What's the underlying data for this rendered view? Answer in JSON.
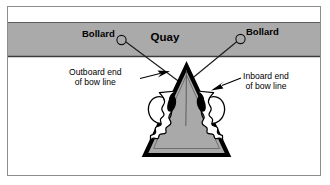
{
  "figure": {
    "title_text": "Mooring bow line diagram",
    "background_color": "#ffffff",
    "frame_color": "#8d8d8d"
  },
  "quay": {
    "label": "Quay",
    "fill_color": "#aaaaaa",
    "edge_color": "#4a4a4a",
    "bollards": [
      {
        "label": "Bollard",
        "side": "left"
      },
      {
        "label": "Bollard",
        "side": "right"
      }
    ]
  },
  "vessel": {
    "name": "bow",
    "hull_fill_color": "#a9a9a9",
    "hull_outline_color": "#000000",
    "deck_line_color": "#1a1a1a"
  },
  "callouts": [
    {
      "id": "outboard",
      "line1": "Outboard end",
      "line2": "of bow line",
      "arrow": "arrow-right"
    },
    {
      "id": "inboard",
      "line1": "Inboard end",
      "line2": "of bow line",
      "arrow": "arrow-down-left"
    }
  ],
  "bow_lines": {
    "count": 2,
    "rope_color": "#ffffff",
    "rope_outline_color": "#000000",
    "eye_splice_color": "#000000"
  }
}
